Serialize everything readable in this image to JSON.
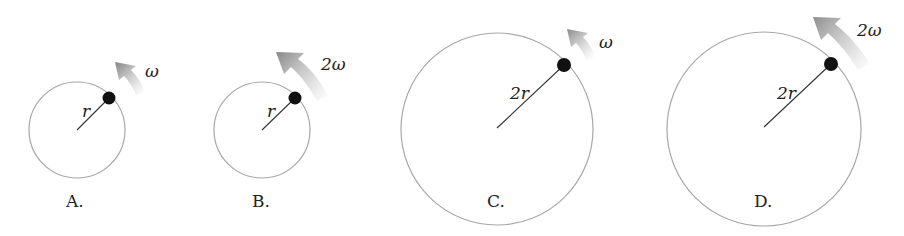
{
  "figure": {
    "colors": {
      "circle": "#a8a8a8",
      "radius_line": "#333333",
      "ball": "#111111",
      "arrow": "#8c8c8c",
      "text": "#222222"
    },
    "options": [
      {
        "label": "A.",
        "radius_label": "r",
        "omega_label": "ω",
        "radius_relative": 1,
        "omega_relative": 1
      },
      {
        "label": "B.",
        "radius_label": "r",
        "omega_label": "2ω",
        "radius_relative": 1,
        "omega_relative": 2
      },
      {
        "label": "C.",
        "radius_label": "2r",
        "omega_label": "ω",
        "radius_relative": 2,
        "omega_relative": 1
      },
      {
        "label": "D.",
        "radius_label": "2r",
        "omega_label": "2ω",
        "radius_relative": 2,
        "omega_relative": 2
      }
    ]
  }
}
